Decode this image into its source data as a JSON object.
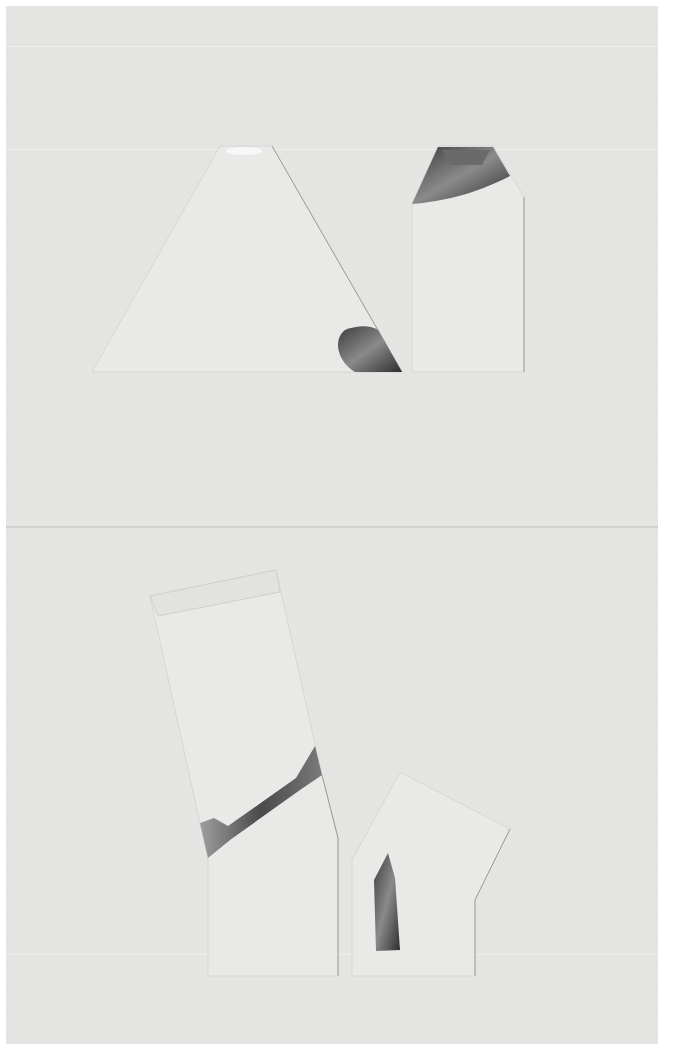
{
  "image": {
    "description": "Photograph of paper collage artwork on textured off-white paper: four cut paper shapes with silver foil accents, arranged in two rows",
    "colors": {
      "paper": "#e4e4e2",
      "shape": "#e9e9e7",
      "foil_dark": "#555555",
      "foil_light": "#9a9a9a",
      "border": "#ffffff"
    },
    "shapes": [
      {
        "name": "trapezoid-top-left",
        "foil": "bottom-right corner"
      },
      {
        "name": "pentagon-top-right",
        "foil": "top roof"
      },
      {
        "name": "tilted-column-bottom-left",
        "foil": "diagonal band"
      },
      {
        "name": "house-bottom-right",
        "foil": "vertical sliver"
      }
    ]
  }
}
